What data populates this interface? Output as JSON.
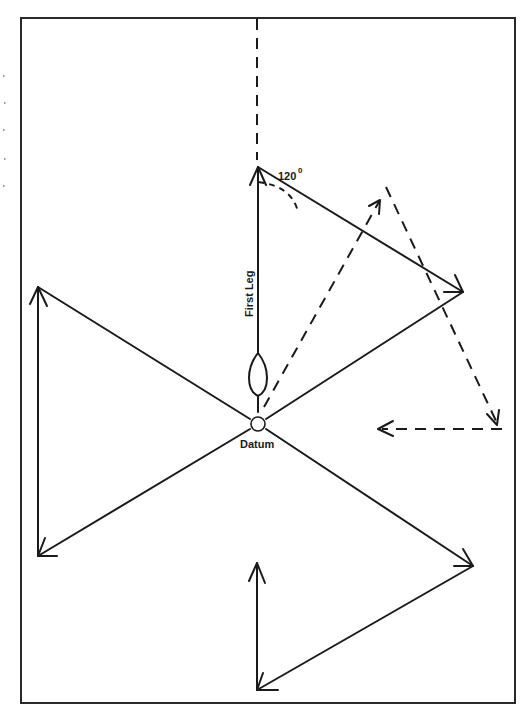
{
  "diagram": {
    "type": "sector-search-pattern",
    "labels": {
      "angle": "120",
      "angle_unit": "0",
      "first_leg": "First Leg",
      "datum": "Datum"
    },
    "colors": {
      "ink": "#1a1a1a",
      "frame": "#2a2a2a",
      "background": "#ffffff"
    },
    "frame": {
      "x": 21,
      "y": 18,
      "width": 494,
      "height": 685
    },
    "datum_point": {
      "x": 258,
      "y": 424
    },
    "solid_legs": [
      {
        "from": [
          258,
          424
        ],
        "to": [
          258,
          167
        ],
        "arrow": true
      },
      {
        "from": [
          258,
          167
        ],
        "to": [
          463,
          292
        ],
        "arrow": true
      },
      {
        "from": [
          463,
          292
        ],
        "to": [
          258,
          424
        ],
        "arrow": false
      },
      {
        "from": [
          258,
          424
        ],
        "to": [
          38,
          556
        ],
        "arrow": true
      },
      {
        "from": [
          38,
          556
        ],
        "to": [
          38,
          287
        ],
        "arrow": true
      },
      {
        "from": [
          38,
          287
        ],
        "to": [
          258,
          424
        ],
        "arrow": false
      },
      {
        "from": [
          258,
          424
        ],
        "to": [
          473,
          566
        ],
        "arrow": true
      },
      {
        "from": [
          473,
          566
        ],
        "to": [
          257,
          690
        ],
        "arrow": true
      },
      {
        "from": [
          257,
          690
        ],
        "to": [
          257,
          563
        ],
        "arrow": true
      }
    ],
    "dashed_legs": [
      {
        "from": [
          257,
          18
        ],
        "to": [
          257,
          167
        ],
        "arrow": false
      },
      {
        "from": [
          262,
          410
        ],
        "to": [
          380,
          200
        ],
        "arrow": true
      },
      {
        "from": [
          386,
          187
        ],
        "to": [
          498,
          425
        ],
        "arrow": true
      },
      {
        "from": [
          502,
          429
        ],
        "to": [
          378,
          429
        ],
        "arrow": true
      }
    ]
  }
}
